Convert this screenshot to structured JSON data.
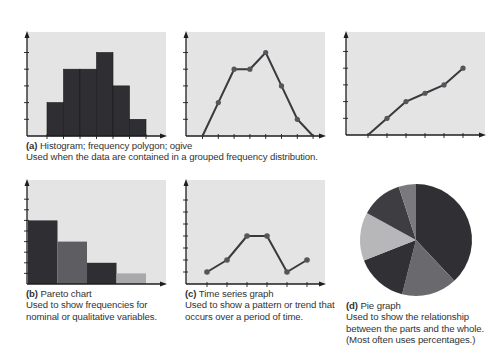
{
  "colors": {
    "plot_background": "#e4e4e4",
    "axis": "#1e1e1e",
    "bar_dark": "#2f2f33",
    "bar_mid": "#5e5e62",
    "bar_light": "#a9a9ab",
    "line": "#3a3a3e",
    "marker": "#55555a"
  },
  "captions": {
    "a": {
      "tag": "(a)",
      "title": "Histogram; frequency polygon; ogive",
      "description": "Used when the data are contained in a grouped frequency distribution."
    },
    "b": {
      "tag": "(b)",
      "title": "Pareto chart",
      "line1": "Used to show frequencies for",
      "line2": "nominal or qualitative variables."
    },
    "c": {
      "tag": "(c)",
      "title": "Time series graph",
      "line1": "Used to show a pattern or trend that",
      "line2": "occurs over a period of time."
    },
    "d": {
      "tag": "(d)",
      "title": "Pie graph",
      "line1": "Used to show the relationship",
      "line2": "between the parts and the whole.",
      "line3": "(Most often uses percentages.)"
    }
  },
  "chart_data": [
    {
      "id": "a-histogram",
      "type": "bar",
      "title": "Histogram",
      "categories": [
        "1",
        "2",
        "3",
        "4",
        "5",
        "6"
      ],
      "values": [
        2,
        4,
        4,
        5,
        3,
        1
      ],
      "ylim": [
        0,
        6
      ],
      "grid": false,
      "xlabel": "",
      "ylabel": ""
    },
    {
      "id": "a-frequency-polygon",
      "type": "line",
      "title": "Frequency polygon",
      "x": [
        0,
        1,
        2,
        3,
        4,
        5,
        6,
        7
      ],
      "values": [
        0,
        2,
        4,
        4,
        5,
        3,
        1,
        0
      ],
      "ylim": [
        0,
        6
      ],
      "grid": false
    },
    {
      "id": "a-ogive",
      "type": "line",
      "title": "Ogive",
      "x": [
        0,
        1,
        2,
        3,
        4,
        5
      ],
      "values": [
        0,
        1,
        2,
        2.5,
        3,
        4
      ],
      "ylim": [
        0,
        6
      ],
      "grid": false
    },
    {
      "id": "b-pareto",
      "type": "bar",
      "title": "Pareto chart",
      "categories": [
        "A",
        "B",
        "C",
        "D"
      ],
      "values": [
        6,
        4,
        2,
        1
      ],
      "ylim": [
        0,
        9
      ],
      "grid": false
    },
    {
      "id": "c-time-series",
      "type": "line",
      "title": "Time series graph",
      "x": [
        1,
        2,
        3,
        4,
        5,
        6
      ],
      "values": [
        1,
        2,
        4,
        4,
        1,
        2
      ],
      "ylim": [
        0,
        7
      ],
      "grid": false
    },
    {
      "id": "d-pie",
      "type": "pie",
      "title": "Pie graph",
      "labels": [
        "Slice 1",
        "Slice 2",
        "Slice 3",
        "Slice 4",
        "Slice 5",
        "Slice 6"
      ],
      "values": [
        38,
        16,
        15,
        14,
        12,
        5
      ]
    }
  ]
}
